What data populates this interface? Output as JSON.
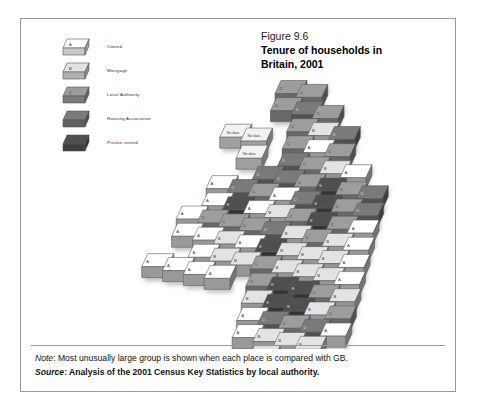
{
  "figure": {
    "number": "Figure 9.6",
    "title_line1": "Tenure of households in",
    "title_line2": "Britain, 2001"
  },
  "legend": {
    "items": [
      {
        "code": "A",
        "label": "Owned",
        "color": "#ffffff"
      },
      {
        "code": "B",
        "label": "Mortgage",
        "color": "#e3e3e3"
      },
      {
        "code": "C",
        "label": "Local Authority",
        "color": "#9d9d9d"
      },
      {
        "code": "D",
        "label": "Housing Association",
        "color": "#7a7a7a"
      },
      {
        "code": "E",
        "label": "Private rented",
        "color": "#4f4f4f"
      }
    ]
  },
  "notes": {
    "note_key": "Note",
    "note_text": ": Most unusually large group is shown when each place is compared with GB.",
    "source_key": "Source",
    "source_text": ": Analysis of the 2001 Census Key Statistics by local authority."
  },
  "chart_data": {
    "type": "heatmap",
    "title": "Tenure of households in Britain, 2001",
    "subtitle": "Figure 9.6",
    "projection": "isometric-block-cartogram",
    "legend_position": "top-left",
    "grid": false,
    "categories": [
      "A",
      "B",
      "C",
      "D",
      "E",
      "No data"
    ],
    "category_labels": {
      "A": "Owned",
      "B": "Mortgage",
      "C": "Local Authority",
      "D": "Housing Association",
      "E": "Private rented",
      "No data": "No data"
    },
    "category_colors": {
      "A": "#ffffff",
      "B": "#e3e3e3",
      "C": "#9d9d9d",
      "D": "#7a7a7a",
      "E": "#4f4f4f",
      "No data": "#f2f2f2"
    },
    "xlabel": "",
    "ylabel": "",
    "tile_geometry": {
      "tile_w": 26,
      "tile_h": 13,
      "tile_depth": 11,
      "origin_x": 150,
      "origin_y": 42
    },
    "cells": [
      {
        "col": 5,
        "row": 0,
        "value": "C"
      },
      {
        "col": 6,
        "row": 0,
        "value": "C"
      },
      {
        "col": 5,
        "row": 1,
        "value": "C"
      },
      {
        "col": 6,
        "row": 1,
        "value": "D"
      },
      {
        "col": 7,
        "row": 1,
        "value": "C"
      },
      {
        "col": 6,
        "row": 2,
        "value": "C"
      },
      {
        "col": 7,
        "row": 2,
        "value": "B"
      },
      {
        "col": 8,
        "row": 2,
        "value": "D"
      },
      {
        "col": 3,
        "row": 3,
        "value": "No data"
      },
      {
        "col": 4,
        "row": 3,
        "value": "No data"
      },
      {
        "col": 6,
        "row": 3,
        "value": "C"
      },
      {
        "col": 7,
        "row": 3,
        "value": "A"
      },
      {
        "col": 8,
        "row": 3,
        "value": "C"
      },
      {
        "col": 4,
        "row": 4,
        "value": "No data"
      },
      {
        "col": 6,
        "row": 4,
        "value": "D"
      },
      {
        "col": 7,
        "row": 4,
        "value": "C"
      },
      {
        "col": 8,
        "row": 4,
        "value": "B"
      },
      {
        "col": 9,
        "row": 4,
        "value": "A"
      },
      {
        "col": 5,
        "row": 5,
        "value": "D"
      },
      {
        "col": 6,
        "row": 5,
        "value": "D"
      },
      {
        "col": 7,
        "row": 5,
        "value": "C"
      },
      {
        "col": 8,
        "row": 5,
        "value": "E"
      },
      {
        "col": 9,
        "row": 5,
        "value": "C"
      },
      {
        "col": 10,
        "row": 5,
        "value": "D"
      },
      {
        "col": 3,
        "row": 6,
        "value": "A"
      },
      {
        "col": 4,
        "row": 6,
        "value": "D"
      },
      {
        "col": 5,
        "row": 6,
        "value": "C"
      },
      {
        "col": 6,
        "row": 6,
        "value": "A"
      },
      {
        "col": 7,
        "row": 6,
        "value": "D"
      },
      {
        "col": 8,
        "row": 6,
        "value": "E"
      },
      {
        "col": 9,
        "row": 6,
        "value": "C"
      },
      {
        "col": 10,
        "row": 6,
        "value": "D"
      },
      {
        "col": 3,
        "row": 7,
        "value": "A"
      },
      {
        "col": 4,
        "row": 7,
        "value": "E"
      },
      {
        "col": 5,
        "row": 7,
        "value": "A"
      },
      {
        "col": 6,
        "row": 7,
        "value": "B"
      },
      {
        "col": 7,
        "row": 7,
        "value": "C"
      },
      {
        "col": 8,
        "row": 7,
        "value": "E"
      },
      {
        "col": 9,
        "row": 7,
        "value": "C"
      },
      {
        "col": 10,
        "row": 7,
        "value": "A"
      },
      {
        "col": 2,
        "row": 8,
        "value": "A"
      },
      {
        "col": 3,
        "row": 8,
        "value": "C"
      },
      {
        "col": 4,
        "row": 8,
        "value": "C"
      },
      {
        "col": 5,
        "row": 8,
        "value": "C"
      },
      {
        "col": 6,
        "row": 8,
        "value": "D"
      },
      {
        "col": 7,
        "row": 8,
        "value": "B"
      },
      {
        "col": 8,
        "row": 8,
        "value": "C"
      },
      {
        "col": 9,
        "row": 8,
        "value": "B"
      },
      {
        "col": 10,
        "row": 8,
        "value": "A"
      },
      {
        "col": 2,
        "row": 9,
        "value": "A"
      },
      {
        "col": 3,
        "row": 9,
        "value": "A"
      },
      {
        "col": 4,
        "row": 9,
        "value": "B"
      },
      {
        "col": 5,
        "row": 9,
        "value": "A"
      },
      {
        "col": 6,
        "row": 9,
        "value": "E"
      },
      {
        "col": 7,
        "row": 9,
        "value": "B"
      },
      {
        "col": 8,
        "row": 9,
        "value": "B"
      },
      {
        "col": 9,
        "row": 9,
        "value": "B"
      },
      {
        "col": 10,
        "row": 9,
        "value": "A"
      },
      {
        "col": 3,
        "row": 10,
        "value": "A"
      },
      {
        "col": 4,
        "row": 10,
        "value": "B"
      },
      {
        "col": 5,
        "row": 10,
        "value": "B"
      },
      {
        "col": 6,
        "row": 10,
        "value": "C"
      },
      {
        "col": 7,
        "row": 10,
        "value": "B"
      },
      {
        "col": 8,
        "row": 10,
        "value": "B"
      },
      {
        "col": 9,
        "row": 10,
        "value": "B"
      },
      {
        "col": 10,
        "row": 10,
        "value": "A"
      },
      {
        "col": 1,
        "row": 11,
        "value": "A"
      },
      {
        "col": 2,
        "row": 11,
        "value": "A"
      },
      {
        "col": 3,
        "row": 11,
        "value": "A"
      },
      {
        "col": 4,
        "row": 11,
        "value": "A"
      },
      {
        "col": 6,
        "row": 11,
        "value": "C"
      },
      {
        "col": 7,
        "row": 11,
        "value": "E"
      },
      {
        "col": 8,
        "row": 11,
        "value": "E"
      },
      {
        "col": 9,
        "row": 11,
        "value": "C"
      },
      {
        "col": 10,
        "row": 11,
        "value": "B"
      },
      {
        "col": 6,
        "row": 12,
        "value": "B"
      },
      {
        "col": 7,
        "row": 12,
        "value": "E"
      },
      {
        "col": 8,
        "row": 12,
        "value": "E"
      },
      {
        "col": 9,
        "row": 12,
        "value": "B"
      },
      {
        "col": 10,
        "row": 12,
        "value": "C"
      },
      {
        "col": 6,
        "row": 13,
        "value": "A"
      },
      {
        "col": 7,
        "row": 13,
        "value": "D"
      },
      {
        "col": 8,
        "row": 13,
        "value": "C"
      },
      {
        "col": 9,
        "row": 13,
        "value": "D"
      },
      {
        "col": 10,
        "row": 13,
        "value": "A"
      },
      {
        "col": 6,
        "row": 14,
        "value": "A"
      },
      {
        "col": 7,
        "row": 14,
        "value": "B"
      },
      {
        "col": 8,
        "row": 14,
        "value": "B"
      },
      {
        "col": 9,
        "row": 14,
        "value": "B"
      },
      {
        "col": 7,
        "row": 15,
        "value": "B"
      },
      {
        "col": 8,
        "row": 15,
        "value": "A"
      }
    ]
  }
}
